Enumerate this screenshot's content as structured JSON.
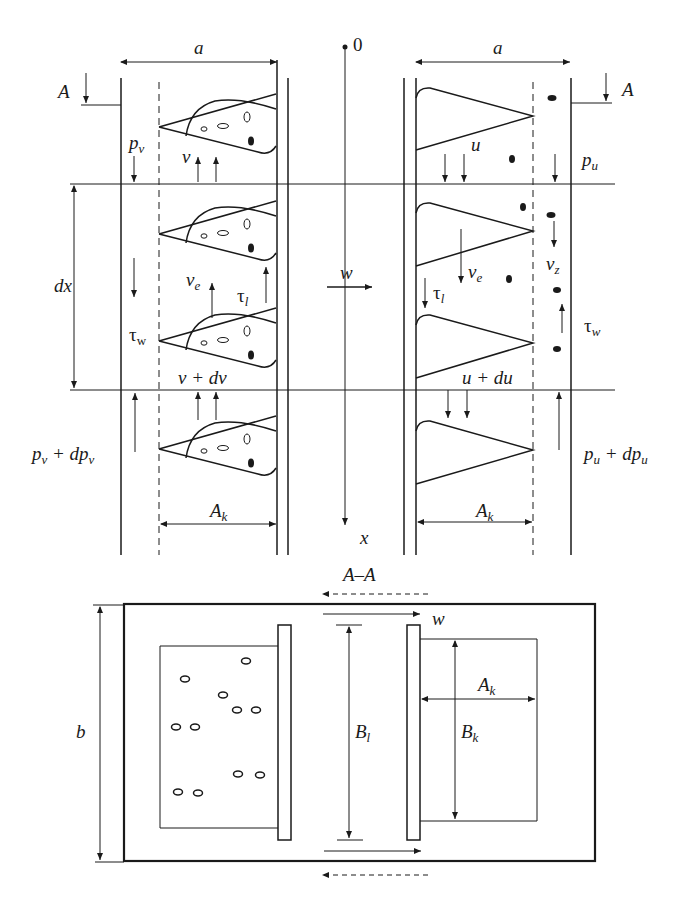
{
  "diagram": {
    "top_view": {
      "origin_label": "0",
      "axis_label": "x",
      "cross_velocity_label": "w",
      "dx_label": "dx",
      "left_channel": {
        "width_label": "a",
        "section_mark": "A",
        "pressure_top": "p",
        "pressure_top_sub": "v",
        "pressure_bottom": "p",
        "pressure_bottom_sub": "v",
        "pressure_bottom_suffix": " + dp",
        "velocity_top": "v",
        "velocity_bottom": "v + dv",
        "entrainment_velocity": "v",
        "entrainment_velocity_sub": "e",
        "interface_stress": "τ",
        "interface_stress_sub": "l",
        "wall_stress": "τ",
        "wall_stress_sub": "w",
        "core_width_label": "A",
        "core_width_sub": "k"
      },
      "right_channel": {
        "width_label": "a",
        "section_mark": "A",
        "pressure_top": "p",
        "pressure_top_sub": "u",
        "pressure_bottom": "p",
        "pressure_bottom_sub": "u",
        "pressure_bottom_suffix": " + dp",
        "velocity_top": "u",
        "velocity_bottom": "u + du",
        "entrainment_velocity": "v",
        "entrainment_velocity_sub": "e",
        "settling_velocity": "v",
        "settling_velocity_sub": "z",
        "interface_stress": "τ",
        "interface_stress_sub": "l",
        "wall_stress": "τ",
        "wall_stress_sub": "w",
        "core_width_label": "A",
        "core_width_sub": "k"
      }
    },
    "section_view": {
      "section_label": "A–A",
      "height_label": "b",
      "cross_velocity_label": "w",
      "gap_length_label": "B",
      "gap_length_sub": "l",
      "core_width_label": "A",
      "core_width_sub": "k",
      "core_height_label": "B",
      "core_height_sub": "k"
    }
  }
}
